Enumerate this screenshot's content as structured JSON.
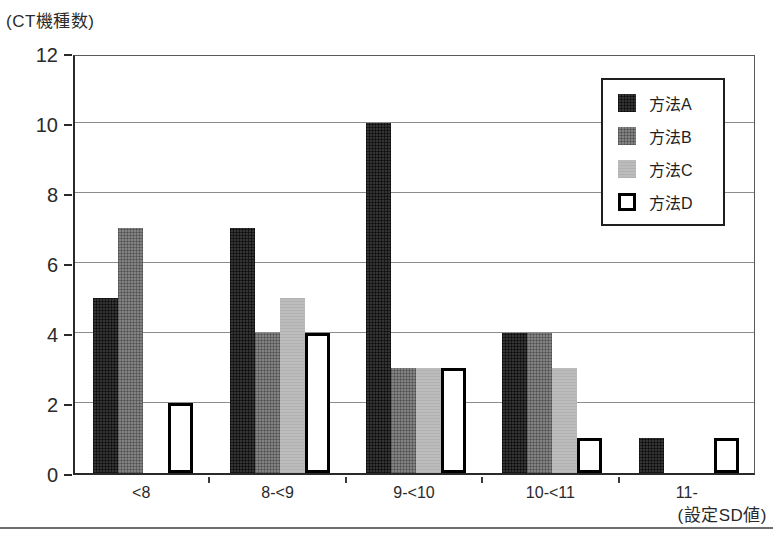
{
  "chart_data": {
    "type": "bar",
    "title": "",
    "y_axis_title": "(CT機種数)",
    "x_axis_title": "(設定SD値)",
    "categories": [
      "<8",
      "8-<9",
      "9-<10",
      "10-<11",
      "11-"
    ],
    "series": [
      {
        "name": "方法A",
        "values": [
          5,
          7,
          10,
          4,
          1
        ],
        "color": "#343434",
        "pattern": "crosshatch-dark"
      },
      {
        "name": "方法B",
        "values": [
          7,
          4,
          3,
          4,
          0
        ],
        "color": "#828282",
        "pattern": "crosshatch-medium"
      },
      {
        "name": "方法C",
        "values": [
          0,
          5,
          3,
          3,
          0
        ],
        "color": "#bcbcbc",
        "pattern": "light-solid"
      },
      {
        "name": "方法D",
        "values": [
          2,
          4,
          3,
          1,
          1
        ],
        "color": "#ffffff",
        "pattern": "outlined",
        "border_color": "#000000"
      }
    ],
    "y_ticks": [
      0,
      2,
      4,
      6,
      8,
      10,
      12
    ],
    "ylim": [
      0,
      12
    ],
    "grid": true,
    "legend_position": "top-right",
    "plot_background": "#ffffff",
    "gridline_color": "#8c8c8c"
  }
}
